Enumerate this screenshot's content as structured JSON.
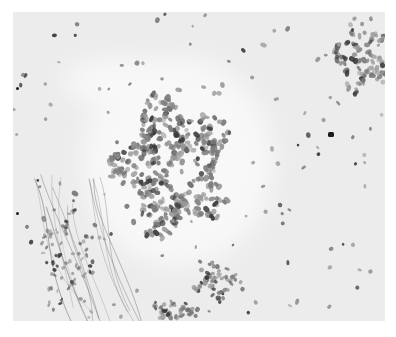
{
  "image": {
    "type": "histology-micrograph",
    "stain": "grayscale",
    "frame": {
      "x": 13,
      "y": 12,
      "width": 372,
      "height": 309
    },
    "colors": {
      "background": "#ffffff",
      "stroma": "#ececec",
      "clear_zone": "#f8f8f8",
      "nucleus_light": "#9a9a9a",
      "nucleus_mid": "#7a7a7a",
      "nucleus_dark": "#3a3a3a",
      "fiber": "#5a5a5a"
    },
    "clusters": [
      {
        "name": "central-cell-cluster",
        "cx": 160,
        "cy": 155,
        "rx": 62,
        "ry": 75,
        "count": 420,
        "seed": 11,
        "size": 3.2
      },
      {
        "name": "top-right-cell-cluster",
        "cx": 350,
        "cy": 45,
        "rx": 30,
        "ry": 45,
        "count": 90,
        "seed": 23,
        "size": 3.0
      },
      {
        "name": "bottom-center-cell-cluster",
        "cx": 205,
        "cy": 270,
        "rx": 28,
        "ry": 22,
        "count": 45,
        "seed": 37,
        "size": 2.8
      },
      {
        "name": "bottom-left-cell-cluster",
        "cx": 165,
        "cy": 298,
        "rx": 28,
        "ry": 12,
        "count": 40,
        "seed": 41,
        "size": 2.7
      },
      {
        "name": "lower-left-fiber-cells",
        "cx": 60,
        "cy": 250,
        "rx": 35,
        "ry": 60,
        "count": 80,
        "seed": 53,
        "size": 2.2
      }
    ],
    "clear_zones": [
      {
        "cx": 165,
        "cy": 150,
        "rx": 95,
        "ry": 105
      },
      {
        "cx": 110,
        "cy": 70,
        "rx": 60,
        "ry": 25
      }
    ],
    "scattered_cells": {
      "count": 130,
      "seed": 71
    },
    "dark_spots": [
      {
        "x": 315,
        "y": 120,
        "w": 6,
        "h": 5
      },
      {
        "x": 3,
        "y": 75,
        "w": 3,
        "h": 3
      },
      {
        "x": 3,
        "y": 200,
        "w": 3,
        "h": 3
      }
    ]
  }
}
